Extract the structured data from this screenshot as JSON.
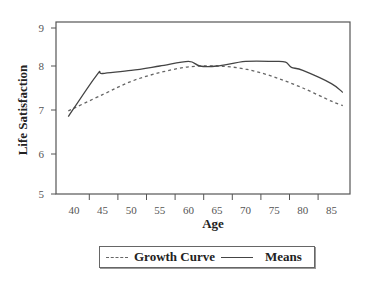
{
  "chart_data": {
    "type": "line",
    "title": "",
    "xlabel": "Age",
    "ylabel": "Life Satisfaction",
    "xlim": [
      37,
      89
    ],
    "ylim": [
      5,
      9
    ],
    "x_ticks": [
      40,
      45,
      50,
      55,
      60,
      65,
      70,
      75,
      80,
      85
    ],
    "y_ticks": [
      5,
      6,
      7,
      8,
      9
    ],
    "grid": false,
    "legend_position": "bottom-center",
    "series": [
      {
        "name": "Growth Curve",
        "style": "dashed",
        "color": "#666666",
        "x": [
          39,
          45,
          50,
          55,
          60,
          65,
          70,
          75,
          80,
          85,
          87
        ],
        "values": [
          6.98,
          7.35,
          7.65,
          7.85,
          7.98,
          8.0,
          7.93,
          7.75,
          7.5,
          7.2,
          7.1
        ]
      },
      {
        "name": "Means",
        "style": "solid",
        "color": "#444444",
        "x": [
          39,
          44,
          45,
          50,
          55,
          60,
          62,
          65,
          70,
          75,
          77,
          78,
          80,
          85,
          87
        ],
        "values": [
          6.85,
          7.8,
          7.83,
          7.9,
          8.0,
          8.12,
          8.0,
          8.0,
          8.12,
          8.12,
          8.1,
          7.97,
          7.9,
          7.6,
          7.4
        ]
      }
    ]
  },
  "legend": {
    "items": [
      {
        "label": "Growth Curve",
        "style": "dashed"
      },
      {
        "label": "Means",
        "style": "solid"
      }
    ]
  },
  "axes": {
    "x_title": "Age",
    "y_title": "Life Satisfaction"
  }
}
